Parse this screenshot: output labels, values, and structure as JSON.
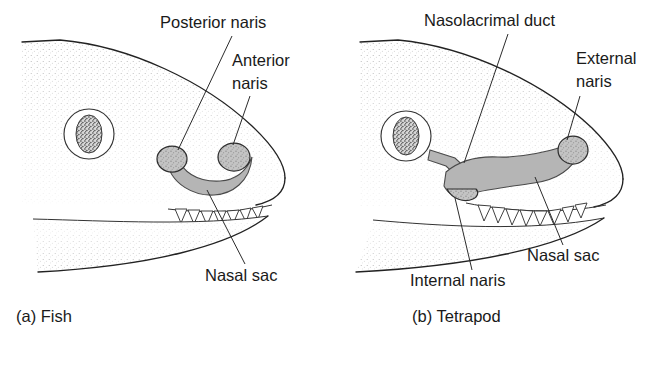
{
  "figure": {
    "background_color": "#ffffff",
    "ink_color": "#222222",
    "sac_fill_color": "#b9b9b9",
    "naris_fill_color": "#c9c9c9",
    "stipple_color": "#8a8a8a"
  },
  "panels": [
    {
      "id": "fish",
      "caption": "(a) Fish",
      "caption_x": 16,
      "caption_y": 322,
      "labels": [
        {
          "name": "posterior-naris",
          "text": "Posterior naris",
          "text_x": 160,
          "text_y": 28,
          "anchor": "start",
          "leader": "M 232 36 L 178 157"
        },
        {
          "name": "anterior-naris",
          "text": "Anterior",
          "text_x": 232,
          "text_y": 66,
          "anchor": "start",
          "leader": "M 250 90 L 225 152"
        },
        {
          "name": "anterior-naris-line2",
          "text": "naris",
          "text_x": 232,
          "text_y": 89,
          "anchor": "start",
          "leader": ""
        },
        {
          "name": "nasal-sac",
          "text": "Nasal sac",
          "text_x": 205,
          "text_y": 281,
          "anchor": "start",
          "leader": "M 247 264 L 206 192"
        }
      ]
    },
    {
      "id": "tetrapod",
      "caption": "(b) Tetrapod",
      "caption_x": 412,
      "caption_y": 322,
      "labels": [
        {
          "name": "nasolacrimal-duct",
          "text": "Nasolacrimal duct",
          "text_x": 424,
          "text_y": 26,
          "anchor": "start",
          "leader": "M 508 34 L 462 168"
        },
        {
          "name": "external-naris",
          "text": "External",
          "text_x": 576,
          "text_y": 64,
          "anchor": "start",
          "leader": "M 580 90 L 561 148"
        },
        {
          "name": "external-naris-line2",
          "text": "naris",
          "text_x": 576,
          "text_y": 87,
          "anchor": "start",
          "leader": ""
        },
        {
          "name": "nasal-sac",
          "text": "Nasal sac",
          "text_x": 527,
          "text_y": 261,
          "anchor": "start",
          "leader": "M 565 245 L 537 179"
        },
        {
          "name": "internal-naris",
          "text": "Internal naris",
          "text_x": 410,
          "text_y": 286,
          "anchor": "start",
          "leader": "M 473 270 L 454 196"
        }
      ]
    }
  ]
}
